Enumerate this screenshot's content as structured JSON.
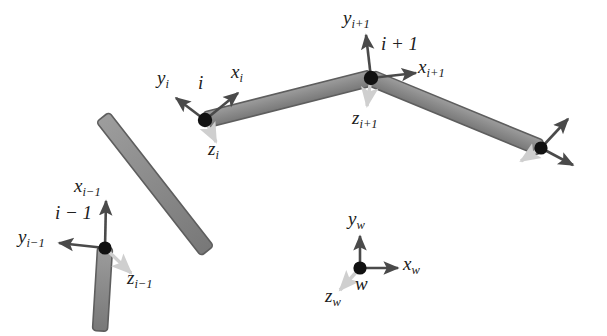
{
  "figure": {
    "type": "diagram",
    "background_color": "#ffffff",
    "link_fill_color": "#8a8a8a",
    "link_stroke_color": "#555555",
    "joint_color": "#111111",
    "axis_arrow_color": "#4a4a4a",
    "z_axis_arrow_color": "#cccccc",
    "label_color": "#202020"
  },
  "joints": [
    {
      "id": "joint-i-minus-1",
      "label": "i − 1",
      "label_text": "i − 1",
      "x": 105,
      "y": 248
    },
    {
      "id": "joint-i",
      "label": "i",
      "label_text": "i",
      "x": 205,
      "y": 120
    },
    {
      "id": "joint-i-plus-1",
      "label": "i + 1",
      "label_text": "i + 1",
      "x": 371,
      "y": 78
    },
    {
      "id": "joint-end-effector",
      "label": "",
      "label_text": "",
      "x": 541,
      "y": 148
    }
  ],
  "links": [
    {
      "id": "link-base",
      "from": [
        100,
        330
      ],
      "to": [
        105,
        248
      ]
    },
    {
      "id": "link-i-minus-1-to-i",
      "from": [
        105,
        248
      ],
      "to": [
        205,
        120
      ]
    },
    {
      "id": "link-i-to-i-plus-1",
      "from": [
        205,
        120
      ],
      "to": [
        371,
        78
      ]
    },
    {
      "id": "link-i-plus-1-to-end",
      "from": [
        371,
        78
      ],
      "to": [
        541,
        148
      ]
    }
  ],
  "frames": [
    {
      "id": "frame-i-minus-1",
      "origin": [
        105,
        248
      ],
      "axes": {
        "x": {
          "label_base": "x",
          "subscript": "i−1",
          "tip": [
            106,
            200
          ]
        },
        "y": {
          "label_base": "y",
          "subscript": "i−1",
          "tip": [
            57,
            243
          ]
        },
        "z": {
          "label_base": "z",
          "subscript": "i−1",
          "tip": [
            133,
            276
          ]
        }
      }
    },
    {
      "id": "frame-i",
      "origin": [
        205,
        120
      ],
      "axes": {
        "x": {
          "label_base": "x",
          "subscript": "i",
          "tip": [
            239,
            92
          ]
        },
        "y": {
          "label_base": "y",
          "subscript": "i",
          "tip": [
            174,
            97
          ]
        },
        "z": {
          "label_base": "z",
          "subscript": "i",
          "tip": [
            218,
            145
          ]
        }
      }
    },
    {
      "id": "frame-i-plus-1",
      "origin": [
        371,
        78
      ],
      "axes": {
        "x": {
          "label_base": "x",
          "subscript": "i+1",
          "tip": [
            417,
            73
          ]
        },
        "y": {
          "label_base": "y",
          "subscript": "i+1",
          "tip": [
            366,
            33
          ]
        },
        "z": {
          "label_base": "z",
          "subscript": "i+1",
          "tip": [
            367,
            108
          ]
        }
      }
    },
    {
      "id": "frame-end-effector",
      "origin": [
        541,
        148
      ],
      "axes": {
        "x": {
          "label_base": "",
          "subscript": "",
          "tip": [
            570,
            118
          ]
        },
        "y": {
          "label_base": "",
          "subscript": "",
          "tip": [
            575,
            166
          ]
        },
        "z": {
          "label_base": "",
          "subscript": "",
          "tip": [
            519,
            163
          ]
        }
      }
    },
    {
      "id": "frame-world",
      "origin": [
        360,
        268
      ],
      "axes": {
        "x": {
          "label_base": "x",
          "subscript": "w",
          "tip": [
            400,
            268
          ]
        },
        "y": {
          "label_base": "y",
          "subscript": "w",
          "tip": [
            360,
            234
          ]
        },
        "z": {
          "label_base": "z",
          "subscript": "w",
          "tip": [
            338,
            292
          ]
        }
      }
    }
  ],
  "labels": {
    "x_i_minus_1": {
      "base": "x",
      "sub": "i−1",
      "x": 78,
      "y": 182
    },
    "y_i_minus_1": {
      "base": "y",
      "sub": "i−1",
      "x": 24,
      "y": 232
    },
    "z_i_minus_1": {
      "base": "z",
      "sub": "i−1",
      "x": 130,
      "y": 275
    },
    "joint_i_minus_1": {
      "text": "i − 1",
      "x": 60,
      "y": 207
    },
    "x_i": {
      "base": "x",
      "sub": "i",
      "x": 232,
      "y": 68
    },
    "y_i": {
      "base": "y",
      "sub": "i",
      "x": 158,
      "y": 72
    },
    "z_i": {
      "base": "z",
      "sub": "i",
      "x": 209,
      "y": 140
    },
    "joint_i": {
      "text": "i",
      "x": 199,
      "y": 77
    },
    "x_i_plus_1": {
      "base": "x",
      "sub": "i+1",
      "x": 419,
      "y": 62
    },
    "y_i_plus_1": {
      "base": "y",
      "sub": "i+1",
      "x": 346,
      "y": 10
    },
    "z_i_plus_1": {
      "base": "z",
      "sub": "i+1",
      "x": 354,
      "y": 113
    },
    "joint_i_plus_1": {
      "text": "i + 1",
      "x": 382,
      "y": 38
    },
    "x_w": {
      "base": "x",
      "sub": "w",
      "x": 404,
      "y": 258
    },
    "y_w": {
      "base": "y",
      "sub": "w",
      "x": 349,
      "y": 210
    },
    "z_w": {
      "base": "z",
      "sub": "w",
      "x": 327,
      "y": 290
    },
    "world_origin": {
      "text": "w",
      "x": 357,
      "y": 277
    }
  }
}
